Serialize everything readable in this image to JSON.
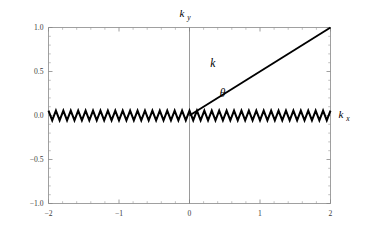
{
  "chart_data": {
    "type": "line",
    "title": "",
    "xlabel": "k_x",
    "ylabel": "k_y",
    "xlim": [
      -2,
      2
    ],
    "ylim": [
      -1.0,
      1.0
    ],
    "grid": false,
    "legend": "none",
    "x_ticks": [
      {
        "value": -2,
        "label": "-2"
      },
      {
        "value": -1,
        "label": "-1"
      },
      {
        "value": 0,
        "label": "0"
      },
      {
        "value": 1,
        "label": "1"
      },
      {
        "value": 2,
        "label": "2"
      }
    ],
    "y_ticks": [
      {
        "value": 1.0,
        "label": "1.0"
      },
      {
        "value": 0.5,
        "label": "0.5"
      },
      {
        "value": 0.0,
        "label": "0.0"
      },
      {
        "value": -0.5,
        "label": "-0.5"
      },
      {
        "value": -1.0,
        "label": "-1.0"
      }
    ],
    "x_minor_count_per_interval": 5,
    "y_minor_count_per_interval": 5,
    "series": [
      {
        "name": "zigzag-wave",
        "type": "line",
        "description": "triangular zigzag wave along kx axis at ky = 0",
        "x_start": -2,
        "x_end": 2,
        "baseline": 0.0,
        "amplitude": 0.055,
        "periods": 38
      },
      {
        "name": "wave-vector-ray",
        "type": "line",
        "description": "straight ray from origin to upper right corner",
        "points": [
          [
            0,
            0
          ],
          [
            2,
            1.0
          ]
        ],
        "slope": 0.5
      }
    ],
    "annotations": [
      {
        "name": "k-label",
        "text": "k",
        "x": 0.33,
        "y": 0.555
      },
      {
        "name": "theta-label",
        "text": "θ",
        "x": 0.47,
        "y": 0.215
      }
    ],
    "axis_labels": {
      "y_axis_symbol": "k",
      "y_axis_subscript": "y",
      "x_axis_symbol": "k",
      "x_axis_subscript": "x"
    },
    "colors": {
      "wave": "#000000",
      "ray": "#000000",
      "frame": "#888888",
      "zero_axis": "#808080",
      "background": "#ffffff",
      "tick_label": "#3a3a3a"
    }
  }
}
